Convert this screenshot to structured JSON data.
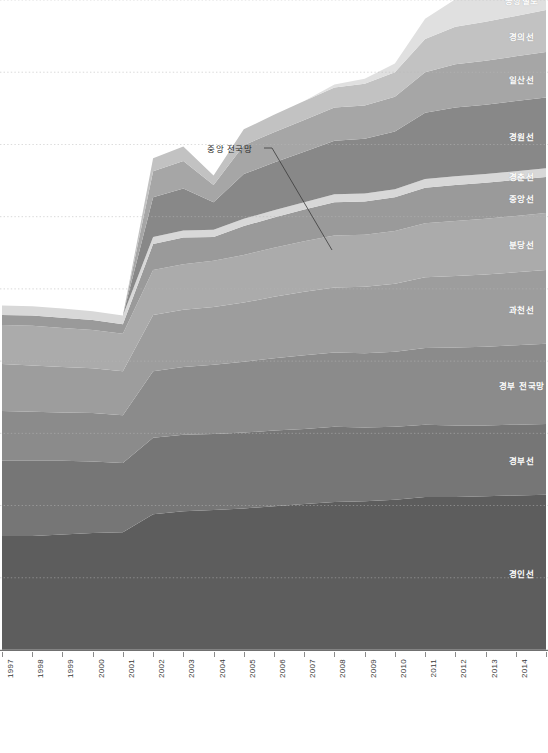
{
  "chart_data": {
    "type": "area",
    "title": "",
    "subtitle": "",
    "xlabel": "",
    "ylabel": "",
    "stacked": true,
    "grid": true,
    "grid_style": "dotted",
    "legend_position": "inline-right",
    "x": [
      1997,
      1998,
      1999,
      2000,
      2001,
      2002,
      2003,
      2004,
      2005,
      2006,
      2007,
      2008,
      2009,
      2010,
      2011,
      2012,
      2013,
      2014,
      2015
    ],
    "categories": [
      "1997",
      "1998",
      "1999",
      "2000",
      "2001",
      "2002",
      "2003",
      "2004",
      "2005",
      "2006",
      "2007",
      "2008",
      "2009",
      "2010",
      "2011",
      "2012",
      "2013",
      "2014",
      "2015"
    ],
    "ylim": [
      0,
      9
    ],
    "y_gridline_values": [
      9,
      8,
      7,
      6,
      5,
      4,
      3,
      2,
      1,
      0
    ],
    "series": [
      {
        "name": "경인선",
        "color": "#5d5d5d",
        "values": [
          1.58,
          1.58,
          1.6,
          1.62,
          1.63,
          1.88,
          1.92,
          1.94,
          1.96,
          1.99,
          2.02,
          2.05,
          2.06,
          2.08,
          2.12,
          2.12,
          2.13,
          2.14,
          2.15
        ]
      },
      {
        "name": "경부선",
        "color": "#767676",
        "values": [
          1.04,
          1.04,
          1.02,
          0.99,
          0.96,
          1.06,
          1.06,
          1.05,
          1.05,
          1.05,
          1.04,
          1.04,
          1.02,
          1.01,
          1.0,
          0.99,
          0.98,
          0.98,
          0.98
        ]
      },
      {
        "name": "경부 전국망",
        "color": "#8b8b8b",
        "values": [
          0.69,
          0.68,
          0.67,
          0.67,
          0.66,
          0.92,
          0.94,
          0.96,
          0.98,
          1.0,
          1.02,
          1.03,
          1.03,
          1.04,
          1.06,
          1.08,
          1.09,
          1.1,
          1.11
        ]
      },
      {
        "name": "과천선",
        "color": "#9d9d9d",
        "values": [
          0.65,
          0.64,
          0.63,
          0.62,
          0.61,
          0.78,
          0.79,
          0.8,
          0.82,
          0.85,
          0.88,
          0.9,
          0.92,
          0.94,
          0.98,
          0.99,
          1.0,
          1.01,
          1.02
        ]
      },
      {
        "name": "분당선",
        "color": "#ababab",
        "values": [
          0.54,
          0.55,
          0.54,
          0.53,
          0.52,
          0.62,
          0.63,
          0.64,
          0.66,
          0.68,
          0.7,
          0.72,
          0.72,
          0.73,
          0.75,
          0.76,
          0.77,
          0.78,
          0.79
        ]
      },
      {
        "name": "중앙선",
        "color": "#9a9a9a",
        "values": [
          0.14,
          0.14,
          0.14,
          0.14,
          0.13,
          0.36,
          0.37,
          0.33,
          0.4,
          0.42,
          0.44,
          0.46,
          0.46,
          0.47,
          0.49,
          0.5,
          0.5,
          0.5,
          0.5
        ]
      },
      {
        "name": "경춘선",
        "color": "#d8d8d8",
        "values": [
          0.13,
          0.13,
          0.13,
          0.12,
          0.12,
          0.1,
          0.1,
          0.1,
          0.1,
          0.1,
          0.1,
          0.11,
          0.11,
          0.11,
          0.12,
          0.12,
          0.12,
          0.12,
          0.12
        ]
      },
      {
        "name": "경원선",
        "color": "#888888",
        "values": [
          0.0,
          0.0,
          0.0,
          0.0,
          0.0,
          0.55,
          0.58,
          0.38,
          0.62,
          0.66,
          0.7,
          0.74,
          0.76,
          0.8,
          0.92,
          0.95,
          0.96,
          0.97,
          0.98
        ]
      },
      {
        "name": "일산선",
        "color": "#a6a6a6",
        "values": [
          0.0,
          0.0,
          0.0,
          0.0,
          0.0,
          0.36,
          0.38,
          0.24,
          0.4,
          0.42,
          0.44,
          0.46,
          0.46,
          0.48,
          0.56,
          0.6,
          0.61,
          0.62,
          0.63
        ]
      },
      {
        "name": "경의선",
        "color": "#c2c2c2",
        "values": [
          0.0,
          0.0,
          0.0,
          0.0,
          0.0,
          0.18,
          0.2,
          0.13,
          0.22,
          0.24,
          0.26,
          0.28,
          0.3,
          0.34,
          0.46,
          0.52,
          0.54,
          0.56,
          0.58
        ]
      },
      {
        "name": "공항철도",
        "color": "#e0e0e0",
        "values": [
          0.0,
          0.0,
          0.0,
          0.0,
          0.0,
          0.0,
          0.0,
          0.0,
          0.0,
          0.0,
          0.0,
          0.04,
          0.07,
          0.12,
          0.28,
          0.38,
          0.42,
          0.44,
          0.46
        ]
      }
    ],
    "annotation": {
      "text": "중앙 전국망",
      "label_x": 207,
      "label_y": 148,
      "leader_from_x": 272,
      "leader_from_y": 148,
      "leader_to_x": 332,
      "leader_to_y": 250
    }
  },
  "axis": {
    "tick_labels": [
      "1997",
      "1998",
      "1999",
      "2000",
      "2001",
      "2002",
      "2003",
      "2004",
      "2005",
      "2006",
      "2007",
      "2008",
      "2009",
      "2010",
      "2011",
      "2012",
      "2013",
      "2014",
      "2015"
    ]
  },
  "footnote": {
    "left": "",
    "right": ""
  },
  "colors": {
    "background": "#ffffff",
    "gridline": "#b9b9b9",
    "axis_rule": "#707070",
    "label_text": "#ffffff",
    "annotation_text": "#2b2b2b"
  }
}
